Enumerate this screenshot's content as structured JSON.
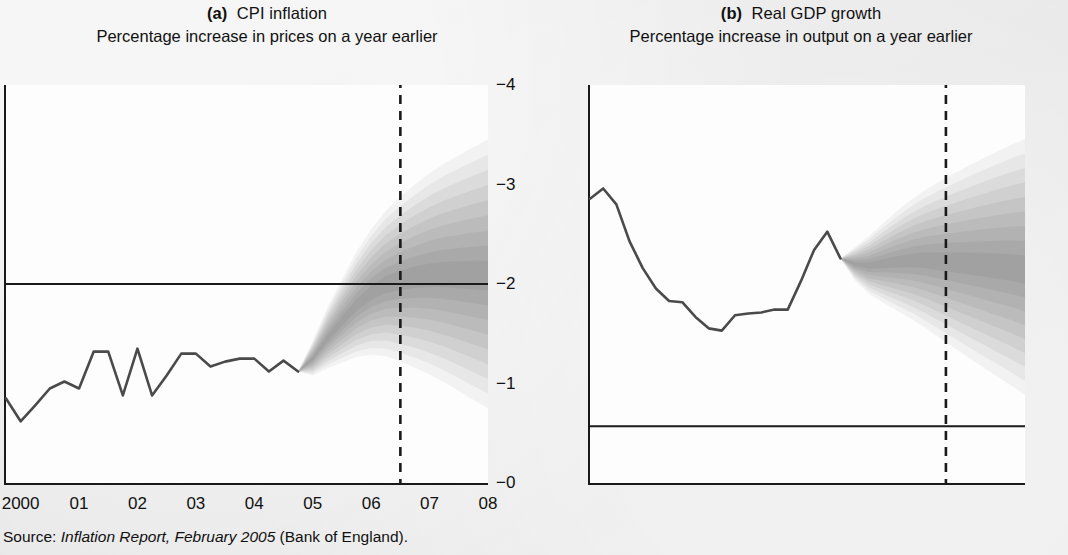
{
  "figure": {
    "source_prefix": "Source: ",
    "source_italic": "Inflation Report, February 2005",
    "source_suffix": " (Bank of England).",
    "background_color": "#e9e9e9",
    "ink_color": "#1a1a1a",
    "line_color": "#4a4a4a",
    "fan_color": "#7f7f7f"
  },
  "panels": [
    {
      "id": "a",
      "label": "(a)",
      "title": "CPI inflation",
      "subtitle": "Percentage increase in prices on a year earlier",
      "y_ticks": [
        "−4",
        "−3",
        "−2",
        "−1",
        "−0"
      ],
      "x_ticks": [
        "2000",
        "01",
        "02",
        "03",
        "04",
        "05",
        "06",
        "07",
        "08"
      ],
      "reference_line_value": 2.0,
      "forecast_start": "2004 Q4",
      "dashed_vertical": "2006 Q3"
    },
    {
      "id": "b",
      "label": "(b)",
      "title": "Real GDP growth",
      "subtitle": "Percentage increase in output on a year earlier",
      "y_ticks": [
        "−6",
        "−5",
        "−4",
        "−3",
        "−2",
        "−1",
        "+",
        "−0",
        "−",
        "−1"
      ],
      "x_ticks": [
        "2000",
        "01",
        "02",
        "03",
        "04",
        "05",
        "06",
        "07",
        "08"
      ],
      "reference_line_value": 0.0,
      "forecast_start": "2004 Q3",
      "dashed_vertical": "2006 Q3"
    }
  ],
  "chart_data": [
    {
      "type": "area",
      "id": "cpi-inflation-fan",
      "title": "CPI inflation",
      "subtitle": "Percentage increase in prices on a year earlier",
      "xlabel": "",
      "ylabel": "Percentage increase in prices on a year earlier",
      "ylim": [
        0,
        4
      ],
      "xlim": [
        1999.75,
        2008.0
      ],
      "grid": false,
      "legend": "none",
      "reference_lines": [
        {
          "orientation": "horizontal",
          "value": 2.0,
          "style": "solid"
        },
        {
          "orientation": "vertical",
          "value": 2006.5,
          "style": "dashed"
        }
      ],
      "x": [
        1999.75,
        2000.0,
        2000.25,
        2000.5,
        2000.75,
        2001.0,
        2001.25,
        2001.5,
        2001.75,
        2002.0,
        2002.25,
        2002.5,
        2002.75,
        2003.0,
        2003.25,
        2003.5,
        2003.75,
        2004.0,
        2004.25,
        2004.5,
        2004.75
      ],
      "series": [
        {
          "name": "CPI inflation (outturn)",
          "values": [
            0.85,
            0.62,
            0.78,
            0.95,
            1.02,
            0.95,
            1.32,
            1.32,
            0.88,
            1.35,
            0.88,
            1.08,
            1.3,
            1.3,
            1.17,
            1.22,
            1.25,
            1.25,
            1.12,
            1.23,
            1.12
          ]
        }
      ],
      "fan": {
        "start_x": 2004.75,
        "end_x": 2008.0,
        "central_path": [
          1.12,
          1.25,
          1.45,
          1.62,
          1.78,
          1.9,
          1.98,
          2.02,
          2.05,
          2.07,
          2.08,
          2.08,
          2.08,
          2.08
        ],
        "bands": 9,
        "band_probability_each": "10%",
        "total_probability": "90%",
        "lower_at_end": 0.75,
        "upper_at_end": 3.45,
        "darkest_center": true
      }
    },
    {
      "type": "area",
      "id": "real-gdp-growth-fan",
      "title": "Real GDP growth",
      "subtitle": "Percentage increase in output on a year earlier",
      "xlabel": "",
      "ylabel": "Percentage increase in output on a year earlier",
      "ylim": [
        -1,
        6
      ],
      "xlim": [
        1999.75,
        2008.0
      ],
      "grid": false,
      "legend": "none",
      "reference_lines": [
        {
          "orientation": "horizontal",
          "value": 0.0,
          "style": "solid"
        },
        {
          "orientation": "vertical",
          "value": 2006.5,
          "style": "dashed"
        }
      ],
      "x": [
        1999.75,
        2000.0,
        2000.25,
        2000.5,
        2000.75,
        2001.0,
        2001.25,
        2001.5,
        2001.75,
        2002.0,
        2002.25,
        2002.5,
        2002.75,
        2003.0,
        2003.25,
        2003.5,
        2003.75,
        2004.0,
        2004.25,
        2004.5
      ],
      "series": [
        {
          "name": "Real GDP growth (outturn)",
          "values": [
            4.0,
            4.18,
            3.9,
            3.25,
            2.78,
            2.42,
            2.2,
            2.18,
            1.92,
            1.72,
            1.68,
            1.95,
            1.98,
            2.0,
            2.05,
            2.05,
            2.55,
            3.1,
            3.42,
            2.95
          ]
        }
      ],
      "fan": {
        "start_x": 2004.5,
        "end_x": 2008.0,
        "central_path": [
          2.95,
          2.85,
          2.82,
          2.85,
          2.88,
          2.9,
          2.9,
          2.88,
          2.86,
          2.84,
          2.82,
          2.8,
          2.78,
          2.75
        ],
        "bands": 9,
        "band_probability_each": "10%",
        "total_probability": "90%",
        "lower_at_end": 0.55,
        "upper_at_end": 5.05,
        "darkest_center": true
      }
    }
  ]
}
